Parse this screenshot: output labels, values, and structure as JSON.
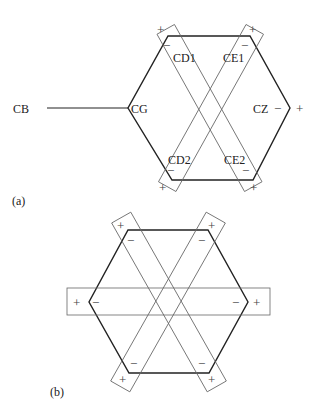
{
  "diagram": {
    "panel_a": {
      "caption": "(a)",
      "atoms": {
        "cb": "CB",
        "cg": "CG",
        "cd1": "CD1",
        "ce1": "CE1",
        "cz": "CZ",
        "cd2": "CD2",
        "ce2": "CE2"
      },
      "signs": {
        "plus": "+",
        "minus": "−"
      }
    },
    "panel_b": {
      "caption": "(b)",
      "signs": {
        "plus": "+",
        "minus": "−"
      }
    },
    "colors": {
      "hexagon": "#222222",
      "boxes": "#666666",
      "text": "#222222"
    }
  }
}
